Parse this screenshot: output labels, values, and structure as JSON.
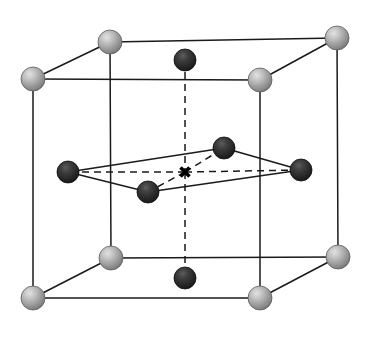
{
  "figure": {
    "width": 370,
    "height": 337,
    "background_color": "#ffffff"
  },
  "colors": {
    "edge_line": "#1a1a1a",
    "dashed_line": "#1a1a1a",
    "light_sphere_base": "#9a9a9a",
    "light_sphere_highlight": "#d8d8d8",
    "light_sphere_shadow": "#6e6e6e",
    "dark_sphere_base": "#2d2d2d",
    "dark_sphere_highlight": "#5a5a5a",
    "dark_sphere_shadow": "#111111",
    "center_marker": "#000000"
  },
  "geometry": {
    "line_width": 1.5,
    "dash_pattern": "7,5",
    "light_sphere_radius": 12,
    "dark_sphere_radius": 11,
    "marker_size": 9,
    "marker_stroke_width": 3.5
  },
  "atoms": {
    "corner_atoms": [
      {
        "id": "corner-top-back-left",
        "label": "Top back left corner atom",
        "x": 110,
        "y": 42,
        "type": "light",
        "r": 12
      },
      {
        "id": "corner-top-back-right",
        "label": "Top back right corner atom",
        "x": 337,
        "y": 38,
        "type": "light",
        "r": 12
      },
      {
        "id": "corner-top-front-left",
        "label": "Top front left corner atom",
        "x": 33,
        "y": 79,
        "type": "light",
        "r": 12
      },
      {
        "id": "corner-top-front-right",
        "label": "Top front right corner atom",
        "x": 260,
        "y": 80,
        "type": "light",
        "r": 12
      },
      {
        "id": "corner-bottom-back-left",
        "label": "Bottom back left corner atom",
        "x": 111,
        "y": 258,
        "type": "light",
        "r": 12
      },
      {
        "id": "corner-bottom-back-right",
        "label": "Bottom back right corner atom",
        "x": 338,
        "y": 257,
        "type": "light",
        "r": 12
      },
      {
        "id": "corner-bottom-front-left",
        "label": "Bottom front left corner atom",
        "x": 33,
        "y": 298,
        "type": "light",
        "r": 12
      },
      {
        "id": "corner-bottom-front-right",
        "label": "Bottom front right corner atom",
        "x": 260,
        "y": 298,
        "type": "light",
        "r": 12
      }
    ],
    "face_center_atoms": [
      {
        "id": "face-top-center",
        "label": "Top face center atom",
        "x": 185,
        "y": 60,
        "type": "dark",
        "r": 11
      },
      {
        "id": "face-bottom-center",
        "label": "Bottom face center atom",
        "x": 185,
        "y": 278,
        "type": "dark",
        "r": 11
      }
    ],
    "mid_plane_atoms": [
      {
        "id": "mid-left",
        "label": "Mid plane left atom",
        "x": 68,
        "y": 172,
        "type": "dark",
        "r": 11
      },
      {
        "id": "mid-right",
        "label": "Mid plane right atom",
        "x": 301,
        "y": 170,
        "type": "dark",
        "r": 11
      },
      {
        "id": "mid-back",
        "label": "Mid plane back atom",
        "x": 224,
        "y": 148,
        "type": "dark",
        "r": 11
      },
      {
        "id": "mid-front",
        "label": "Mid plane front atom",
        "x": 148,
        "y": 192,
        "type": "dark",
        "r": 11
      }
    ],
    "center_marker": {
      "id": "body-center-marker",
      "label": "Body center X marker",
      "x": 185,
      "y": 172,
      "glyph": "X"
    }
  },
  "bonds": {
    "solid_edges": [
      {
        "id": "edge-top-back",
        "label": "Top back edge",
        "x1": 110,
        "y1": 42,
        "x2": 337,
        "y2": 38
      },
      {
        "id": "edge-top-left-diag",
        "label": "Top left diagonal edge",
        "x1": 110,
        "y1": 42,
        "x2": 33,
        "y2": 79
      },
      {
        "id": "edge-top-right-diag",
        "label": "Top right diagonal edge",
        "x1": 337,
        "y1": 38,
        "x2": 260,
        "y2": 80
      },
      {
        "id": "edge-top-front",
        "label": "Top front edge",
        "x1": 33,
        "y1": 79,
        "x2": 260,
        "y2": 80
      },
      {
        "id": "edge-vert-back-left",
        "label": "Back left vertical edge",
        "x1": 110,
        "y1": 42,
        "x2": 111,
        "y2": 258
      },
      {
        "id": "edge-vert-back-right",
        "label": "Back right vertical edge",
        "x1": 337,
        "y1": 38,
        "x2": 338,
        "y2": 257
      },
      {
        "id": "edge-vert-front-left",
        "label": "Front left vertical edge",
        "x1": 33,
        "y1": 79,
        "x2": 33,
        "y2": 298
      },
      {
        "id": "edge-vert-front-right",
        "label": "Front right vertical edge",
        "x1": 260,
        "y1": 80,
        "x2": 260,
        "y2": 298
      },
      {
        "id": "edge-bottom-back",
        "label": "Bottom back edge",
        "x1": 111,
        "y1": 258,
        "x2": 338,
        "y2": 257
      },
      {
        "id": "edge-bottom-left-diag",
        "label": "Bottom left diagonal edge",
        "x1": 111,
        "y1": 258,
        "x2": 33,
        "y2": 298
      },
      {
        "id": "edge-bottom-right-diag",
        "label": "Bottom right diagonal edge",
        "x1": 338,
        "y1": 257,
        "x2": 260,
        "y2": 298
      },
      {
        "id": "edge-bottom-front",
        "label": "Bottom front edge",
        "x1": 33,
        "y1": 298,
        "x2": 260,
        "y2": 298
      },
      {
        "id": "rhombus-left-back",
        "label": "Rhombus left to back edge",
        "x1": 68,
        "y1": 172,
        "x2": 224,
        "y2": 148
      },
      {
        "id": "rhombus-back-right",
        "label": "Rhombus back to right edge",
        "x1": 224,
        "y1": 148,
        "x2": 301,
        "y2": 170
      },
      {
        "id": "rhombus-right-front",
        "label": "Rhombus right to front edge",
        "x1": 301,
        "y1": 170,
        "x2": 148,
        "y2": 192
      },
      {
        "id": "rhombus-front-left",
        "label": "Rhombus front to left edge",
        "x1": 148,
        "y1": 192,
        "x2": 68,
        "y2": 172
      }
    ],
    "dashed_edges": [
      {
        "id": "dash-vertical-axis-top",
        "label": "Vertical axis top dashed line",
        "x1": 185,
        "y1": 60,
        "x2": 185,
        "y2": 172
      },
      {
        "id": "dash-vertical-axis-bottom",
        "label": "Vertical axis bottom dashed line",
        "x1": 185,
        "y1": 172,
        "x2": 185,
        "y2": 278
      },
      {
        "id": "dash-center-to-left",
        "label": "Center to left atom dashed line",
        "x1": 185,
        "y1": 172,
        "x2": 68,
        "y2": 172
      },
      {
        "id": "dash-center-to-right",
        "label": "Center to right atom dashed line",
        "x1": 185,
        "y1": 172,
        "x2": 301,
        "y2": 170
      },
      {
        "id": "dash-center-to-back",
        "label": "Center to back atom dashed line",
        "x1": 185,
        "y1": 172,
        "x2": 224,
        "y2": 148
      },
      {
        "id": "dash-center-to-front",
        "label": "Center to front atom dashed line",
        "x1": 185,
        "y1": 172,
        "x2": 148,
        "y2": 192
      }
    ]
  }
}
